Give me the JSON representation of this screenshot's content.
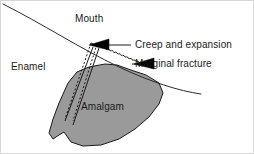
{
  "figure": {
    "background_color": "#ffffff",
    "border_color": "#d8d8d8",
    "width": 254,
    "height": 154
  },
  "labels": {
    "mouth": "Mouth",
    "enamel": "Enamel",
    "amalgam": "Amalgam",
    "creep_and_expansion": "Creep and expansion",
    "marginal_fracture": "Marginal fracture"
  },
  "shapes": {
    "enamel_curve": {
      "name": "enamel-surface-curve",
      "stroke": "#2b2b2b",
      "stroke_width": 1,
      "path": "M 2 3 C 40 22 80 48 118 66 C 150 81 178 90 200 93"
    },
    "amalgam_fill": {
      "name": "amalgam-restoration",
      "fill": "#9a9a9a",
      "stroke": "#1a1a1a",
      "stroke_width": 1,
      "path": "M 67 82 L 76 71 L 88 66 L 104 63 L 116 64 L 130 69 L 145 74 L 158 82 L 162 92 L 158 103 L 148 116 L 134 128 L 118 138 L 100 144 L 82 145 L 70 141 L 63 131 L 58 134 L 52 138 L 48 132 L 52 118 L 58 102 Z"
    },
    "cavity_outline": {
      "name": "cavity-wall-outline",
      "stroke": "#1a1a1a",
      "stroke_width": 1,
      "path": "M 92 45 L 66 116 M 92 45 L 70 120"
    },
    "dashed_margin": {
      "name": "original-margin-dashed",
      "stroke": "#1a1a1a",
      "stroke_width": 1,
      "dash": "2,2",
      "paths": [
        "M 90 42 L 64 118",
        "M 96 43 L 72 120",
        "M 90 42 C 106 48 124 56 142 63",
        "M 96 43 C 112 50 130 58 148 65"
      ]
    },
    "arrow_creep": {
      "name": "creep-arrowhead",
      "fill": "#000000",
      "points": "88,44 108,38 108,49",
      "leader": "M 108 44 L 130 44"
    },
    "arrow_fracture": {
      "name": "fracture-arrowhead",
      "fill": "#000000",
      "points": "133,63 153,57 153,68",
      "leader": "M 153 63 L 131 63"
    }
  },
  "colors": {
    "amalgam_grey": "#9a9a9a",
    "line_black": "#1a1a1a",
    "arrow_black": "#000000",
    "text": "#1a1a1a"
  }
}
